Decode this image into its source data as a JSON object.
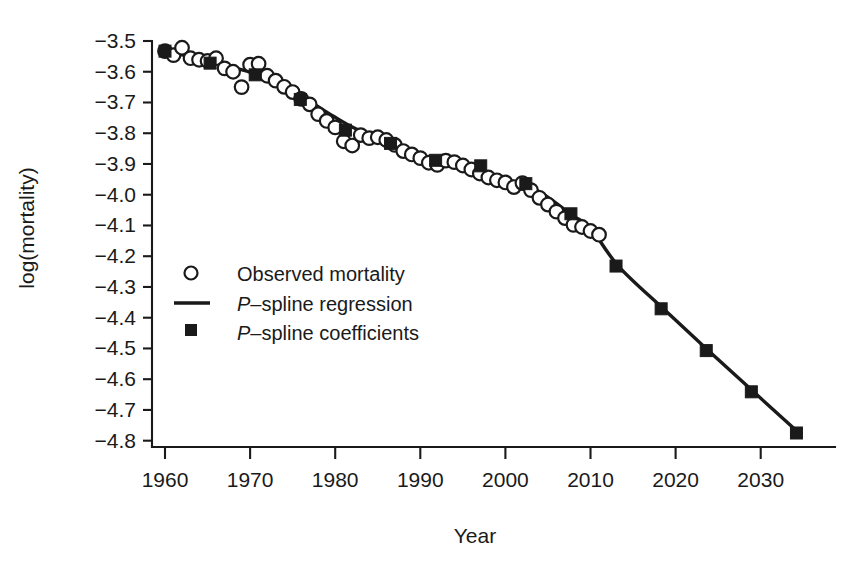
{
  "chart_data": {
    "type": "line",
    "title": "",
    "xlabel": "Year",
    "ylabel": "log(mortality)",
    "xlim": [
      1958,
      2037
    ],
    "ylim": [
      -4.85,
      -3.47
    ],
    "grid": false,
    "legend_position": "center-left",
    "x_ticks": [
      1960,
      1970,
      1980,
      1990,
      2000,
      2010,
      2020,
      2030
    ],
    "x_tick_labels": [
      "1960",
      "1970",
      "1980",
      "1990",
      "2000",
      "2010",
      "2020",
      "2030"
    ],
    "y_ticks": [
      -3.5,
      -3.6,
      -3.7,
      -3.8,
      -3.9,
      -4.0,
      -4.1,
      -4.2,
      -4.3,
      -4.4,
      -4.5,
      -4.6,
      -4.7,
      -4.8
    ],
    "y_tick_labels": [
      "-3.5",
      "-3.6",
      "-3.7",
      "-3.8",
      "-3.9",
      "-4.0",
      "-4.1",
      "-4.2",
      "-4.3",
      "-4.4",
      "-4.5",
      "-4.6",
      "-4.7",
      "-4.8"
    ],
    "series": [
      {
        "name": "Observed mortality",
        "marker": "open-circle",
        "x": [
          1960,
          1961,
          1962,
          1963,
          1964,
          1965,
          1966,
          1967,
          1968,
          1969,
          1970,
          1971,
          1972,
          1973,
          1974,
          1975,
          1976,
          1977,
          1978,
          1979,
          1980,
          1981,
          1982,
          1983,
          1984,
          1985,
          1986,
          1987,
          1988,
          1989,
          1990,
          1991,
          1992,
          1993,
          1994,
          1995,
          1996,
          1997,
          1998,
          1999,
          2000,
          2001,
          2002,
          2003,
          2004,
          2005,
          2006,
          2007,
          2008,
          2009,
          2010,
          2011
        ],
        "y": [
          -3.533,
          -3.546,
          -3.522,
          -3.556,
          -3.561,
          -3.565,
          -3.556,
          -3.589,
          -3.6,
          -3.65,
          -3.577,
          -3.574,
          -3.613,
          -3.629,
          -3.649,
          -3.666,
          -3.688,
          -3.706,
          -3.738,
          -3.76,
          -3.781,
          -3.826,
          -3.84,
          -3.806,
          -3.816,
          -3.813,
          -3.822,
          -3.838,
          -3.858,
          -3.869,
          -3.881,
          -3.896,
          -3.903,
          -3.889,
          -3.894,
          -3.905,
          -3.918,
          -3.931,
          -3.944,
          -3.953,
          -3.96,
          -3.975,
          -3.962,
          -3.985,
          -4.01,
          -4.032,
          -4.055,
          -4.076,
          -4.098,
          -4.105,
          -4.118,
          -4.13
        ]
      },
      {
        "name": "P-spline regression",
        "marker": "line",
        "x": [
          1960,
          1962,
          1964,
          1966,
          1968,
          1970,
          1972,
          1974,
          1976,
          1978,
          1980,
          1982,
          1984,
          1986,
          1988,
          1990,
          1992,
          1994,
          1996,
          1998,
          2000,
          2002,
          2004,
          2006,
          2008,
          2010,
          2013.3,
          2018.6,
          2023.9,
          2029.2,
          2034.5
        ],
        "y": [
          -3.533,
          -3.545,
          -3.558,
          -3.572,
          -3.586,
          -3.602,
          -3.622,
          -3.648,
          -3.68,
          -3.714,
          -3.748,
          -3.78,
          -3.806,
          -3.826,
          -3.848,
          -3.872,
          -3.893,
          -3.901,
          -3.912,
          -3.93,
          -3.95,
          -3.966,
          -3.99,
          -4.028,
          -4.07,
          -4.108,
          -4.233,
          -4.372,
          -4.508,
          -4.642,
          -4.775
        ]
      },
      {
        "name": "P-spline coefficients",
        "marker": "filled-square",
        "x": [
          1960,
          1965.3,
          1970.6,
          1975.9,
          1981.2,
          1986.5,
          1991.8,
          1997.1,
          2002.4,
          2007.7,
          2013.0,
          2018.3,
          2023.6,
          2028.9,
          2034.2
        ],
        "y": [
          -3.533,
          -3.572,
          -3.61,
          -3.69,
          -3.79,
          -3.833,
          -3.888,
          -3.906,
          -3.964,
          -4.062,
          -4.232,
          -4.371,
          -4.507,
          -4.641,
          -4.775
        ]
      }
    ]
  },
  "legend": {
    "items": [
      {
        "marker": "open-circle",
        "prefix": "",
        "label": "Observed mortality"
      },
      {
        "marker": "line",
        "prefix": "P",
        "label": "–spline regression"
      },
      {
        "marker": "filled-square",
        "prefix": "P",
        "label": "–spline coefficients"
      }
    ]
  },
  "axes": {
    "x_title": "Year",
    "y_title": "log(mortality)"
  },
  "colors": {
    "ink": "#1a1a1a",
    "background": "#ffffff",
    "marker_fill": "#ffffff"
  }
}
